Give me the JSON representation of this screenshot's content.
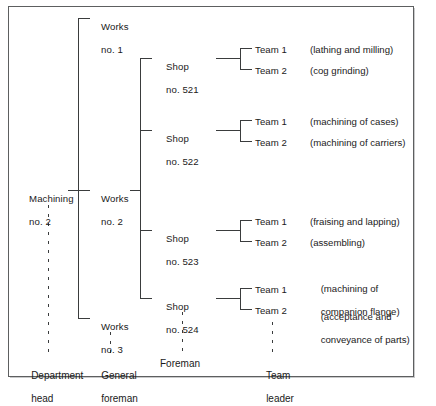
{
  "diagram": {
    "frame_color": "#5d5f60",
    "line_color": "#3a3c3d",
    "background": "#ffffff"
  },
  "root": {
    "line1": "Machining",
    "line2": "no. 2"
  },
  "works": [
    {
      "line1": "Works",
      "line2": "no. 1"
    },
    {
      "line1": "Works",
      "line2": "no. 2"
    },
    {
      "line1": "Works",
      "line2": "no. 3"
    }
  ],
  "shops": [
    {
      "line1": "Shop",
      "line2": "no. 521",
      "teams": [
        {
          "label": "Team 1",
          "desc_line1": "(lathing and milling)",
          "desc_line2": ""
        },
        {
          "label": "Team 2",
          "desc_line1": "(cog grinding)",
          "desc_line2": ""
        }
      ]
    },
    {
      "line1": "Shop",
      "line2": "no. 522",
      "teams": [
        {
          "label": "Team 1",
          "desc_line1": "(machining of cases)",
          "desc_line2": ""
        },
        {
          "label": "Team 2",
          "desc_line1": "(machining of carriers)",
          "desc_line2": ""
        }
      ]
    },
    {
      "line1": "Shop",
      "line2": "no. 523",
      "teams": [
        {
          "label": "Team 1",
          "desc_line1": "(fraising and lapping)",
          "desc_line2": ""
        },
        {
          "label": "Team 2",
          "desc_line1": "(assembling)",
          "desc_line2": ""
        }
      ]
    },
    {
      "line1": "Shop",
      "line2": "no. 524",
      "teams": [
        {
          "label": "Team 1",
          "desc_line1": "(machining of",
          "desc_line2": "companion flange)"
        },
        {
          "label": "Team 2",
          "desc_line1": "(acceptance and",
          "desc_line2": "conveyance of parts)"
        }
      ]
    }
  ],
  "roles": [
    {
      "line1": "Department",
      "line2": "head"
    },
    {
      "line1": "General",
      "line2": "foreman"
    },
    {
      "line1": "Foreman",
      "line2": ""
    },
    {
      "line1": "Team",
      "line2": "leader"
    }
  ]
}
